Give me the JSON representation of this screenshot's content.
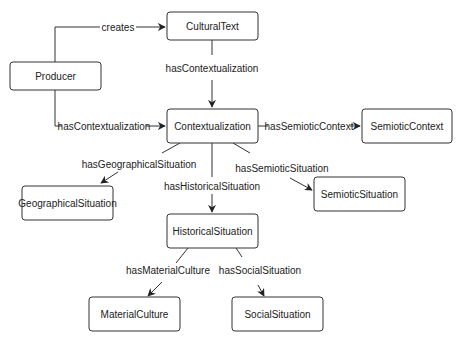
{
  "nodes": [
    {
      "id": "CulturalText",
      "label": "CulturalText"
    },
    {
      "id": "Producer",
      "label": "Producer"
    },
    {
      "id": "Contextualization",
      "label": "Contextualization"
    },
    {
      "id": "SemioticContext",
      "label": "SemioticContext"
    },
    {
      "id": "GeographicalSituation",
      "label": "GeographicalSituation"
    },
    {
      "id": "SemioticSituation",
      "label": "SemioticSituation"
    },
    {
      "id": "HistoricalSituation",
      "label": "HistoricalSituation"
    },
    {
      "id": "MaterialCulture",
      "label": "MaterialCulture"
    },
    {
      "id": "SocialSituation",
      "label": "SocialSituation"
    }
  ],
  "edges": [
    {
      "from": "Producer",
      "to": "CulturalText",
      "label": "creates"
    },
    {
      "from": "CulturalText",
      "to": "Contextualization",
      "label": "hasContextualization"
    },
    {
      "from": "Producer",
      "to": "Contextualization",
      "label": "hasContextualization"
    },
    {
      "from": "Contextualization",
      "to": "SemioticContext",
      "label": "hasSemioticContext"
    },
    {
      "from": "Contextualization",
      "to": "GeographicalSituation",
      "label": "hasGeographicalSituation"
    },
    {
      "from": "Contextualization",
      "to": "HistoricalSituation",
      "label": "hasHistoricalSituation"
    },
    {
      "from": "Contextualization",
      "to": "SemioticSituation",
      "label": "hasSemioticSituation"
    },
    {
      "from": "HistoricalSituation",
      "to": "MaterialCulture",
      "label": "hasMaterialCulture"
    },
    {
      "from": "HistoricalSituation",
      "to": "SocialSituation",
      "label": "hasSocialSituation"
    }
  ]
}
